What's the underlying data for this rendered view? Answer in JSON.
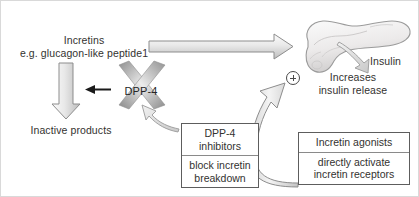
{
  "diagram": {
    "title_hidden": "",
    "labels": {
      "incretins_line1": "Incretins",
      "incretins_line2": "e.g. glucagon-like peptide1",
      "inactive_products": "Inactive products",
      "dpp4": "DPP-4",
      "insulin": "Insulin",
      "increases_line1": "Increases",
      "increases_line2": "insulin release",
      "plus_sign": "+"
    },
    "boxes": [
      {
        "name": "dpp4-inhibitors",
        "head": "DPP-4",
        "head2": "inhibitors",
        "body": "block incretin",
        "body2": "breakdown"
      },
      {
        "name": "incretin-agonists",
        "head": "Incretin agonists",
        "head2": "",
        "body": "directly activate",
        "body2": "incretin receptors"
      }
    ],
    "icons": {
      "pancreas": "pancreas-organ",
      "x_cross": "dpp4-enzyme-cross",
      "plus": "stimulation-plus-icon"
    },
    "colors": {
      "arrow_fill_light": "#eeeeee",
      "arrow_fill_mid": "#cfcfcf",
      "arrow_stroke": "#8d8d8d",
      "cross_dark": "#8f8f8f",
      "cross_light": "#e4e4e4",
      "text": "#33322f",
      "black_arrow": "#1a1a1a",
      "pancreas_fill": "#eceaea",
      "pancreas_stroke": "#9b9b9b",
      "border": "#d9d9d9"
    }
  }
}
